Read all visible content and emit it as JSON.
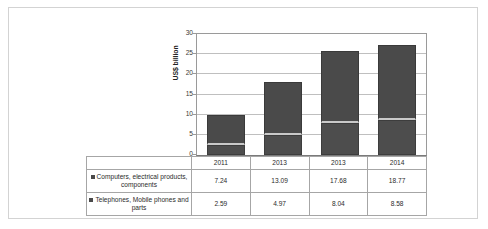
{
  "chart_data": {
    "type": "bar",
    "subtype": "stacked-column-with-data-table",
    "title": "",
    "xlabel": "",
    "ylabel": "US$ billion",
    "categories": [
      "2011",
      "2013",
      "2013",
      "2014"
    ],
    "ylim": [
      0,
      30
    ],
    "y_ticks": [
      0,
      5,
      10,
      15,
      20,
      25,
      30
    ],
    "y_tick_labels": [
      "0",
      "5",
      "10",
      "15",
      "20",
      "25",
      "30"
    ],
    "grid": true,
    "legend_position": "data-table-left",
    "series": [
      {
        "name": "Computers, electrical products, components",
        "values": [
          7.24,
          13.09,
          17.68,
          18.77
        ],
        "color": "#4a4a4a",
        "stack_position": "upper"
      },
      {
        "name": "Telephones, Mobile phones and parts",
        "values": [
          2.59,
          4.97,
          8.04,
          8.58
        ],
        "color": "#4d4d4d",
        "stack_position": "lower"
      }
    ],
    "totals": [
      9.83,
      18.06,
      25.72,
      27.35
    ]
  },
  "colors": {
    "frame_border": "#d3d3d3",
    "plot_border": "#9a9a9a",
    "gridline": "#bfbfbf",
    "table_border": "#a6a6a6",
    "bar_dark": "#4a4a4a",
    "separator": "#c9c9c9"
  }
}
